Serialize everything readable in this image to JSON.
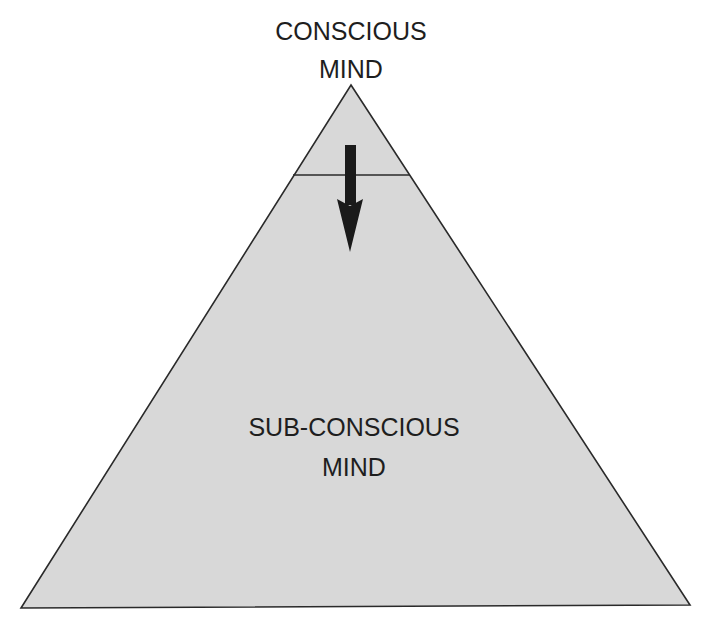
{
  "diagram": {
    "top_label": {
      "line1": "CONSCIOUS",
      "line2": "MIND"
    },
    "bottom_label": {
      "line1": "SUB-CONSCIOUS",
      "line2": "MIND"
    },
    "arrow": {
      "direction": "down",
      "meaning": "conscious-to-subconscious"
    },
    "colors": {
      "fill": "#d8d8d8",
      "stroke": "#2a2a2a",
      "arrow": "#1a1a1a",
      "text": "#1e1e1e",
      "background": "#ffffff"
    }
  }
}
